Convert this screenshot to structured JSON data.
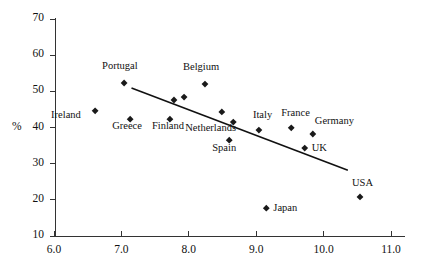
{
  "chart_data": {
    "type": "scatter",
    "title": "",
    "xlabel": "",
    "ylabel": "%",
    "xlim": [
      6.0,
      11.0
    ],
    "ylim": [
      10,
      70
    ],
    "grid": false,
    "legend": "none",
    "xticks": [
      "6.0",
      "7.0",
      "8.0",
      "9.0",
      "10.0",
      "11.0"
    ],
    "xtick_values": [
      6.0,
      7.0,
      8.0,
      9.0,
      10.0,
      11.0
    ],
    "yticks": [
      "10",
      "20",
      "30",
      "40",
      "50",
      "60",
      "70"
    ],
    "ytick_values": [
      10,
      20,
      30,
      40,
      50,
      60,
      70
    ],
    "points": [
      {
        "label": "Ireland",
        "x": 6.61,
        "y": 44.6,
        "label_dx": -44,
        "label_dy": 5
      },
      {
        "label": "Portugal",
        "x": 7.04,
        "y": 52.3,
        "label_dx": -22,
        "label_dy": -16
      },
      {
        "label": "Greece",
        "x": 7.13,
        "y": 42.3,
        "label_dx": -18,
        "label_dy": 8
      },
      {
        "label": "Finland",
        "x": 7.72,
        "y": 42.3,
        "label_dx": -18,
        "label_dy": 8
      },
      {
        "label": "",
        "x": 7.78,
        "y": 47.6,
        "label_dx": 0,
        "label_dy": 0
      },
      {
        "label": "",
        "x": 7.93,
        "y": 48.4,
        "label_dx": 0,
        "label_dy": 0
      },
      {
        "label": "Belgium",
        "x": 8.24,
        "y": 52.0,
        "label_dx": -22,
        "label_dy": -16
      },
      {
        "label": "",
        "x": 8.49,
        "y": 44.3,
        "label_dx": 0,
        "label_dy": 0
      },
      {
        "label": "Netherlands",
        "x": 8.66,
        "y": 41.5,
        "label_dx": -48,
        "label_dy": 7
      },
      {
        "label": "Spain",
        "x": 8.6,
        "y": 36.5,
        "label_dx": -17,
        "label_dy": 9
      },
      {
        "label": "Italy",
        "x": 9.04,
        "y": 39.3,
        "label_dx": -6,
        "label_dy": -14
      },
      {
        "label": "Japan",
        "x": 9.15,
        "y": 17.7,
        "label_dx": 7,
        "label_dy": 1
      },
      {
        "label": "UK",
        "x": 9.72,
        "y": 34.3,
        "label_dx": 7,
        "label_dy": 1
      },
      {
        "label": "France",
        "x": 9.52,
        "y": 39.9,
        "label_dx": -10,
        "label_dy": -14
      },
      {
        "label": "Germany",
        "x": 9.84,
        "y": 38.2,
        "label_dx": 2,
        "label_dy": -12
      },
      {
        "label": "USA",
        "x": 10.54,
        "y": 20.8,
        "label_dx": -8,
        "label_dy": -13
      }
    ],
    "trend_line": {
      "x_start": 7.15,
      "y_start": 50.9,
      "x_end": 10.36,
      "y_end": 28.2
    }
  },
  "colors": {
    "marker": "#1a1a1a",
    "axis": "#333333",
    "trend": "#111111",
    "background": "#ffffff"
  }
}
